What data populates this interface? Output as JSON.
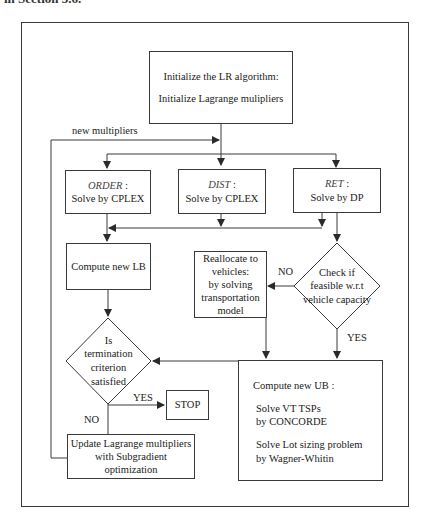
{
  "caption_fragment": "in Section 5.6.",
  "nodes": {
    "init": {
      "line1": "Initialize the LR algorithm:",
      "line2": "Initialize Lagrange mulipliers"
    },
    "order": {
      "name": "ORDER",
      "suffix": " :",
      "action": "Solve by CPLEX"
    },
    "dist": {
      "name": "DIST",
      "suffix": " :",
      "action": "Solve by CPLEX"
    },
    "ret": {
      "name": "RET",
      "suffix": " :",
      "action": "Solve by DP"
    },
    "compute_lb": {
      "label": "Compute new LB"
    },
    "reallocate": {
      "lines": [
        "Reallocate to",
        "vehicles:",
        "by solving",
        "transportation",
        "model"
      ]
    },
    "check_feasible": {
      "lines": [
        "Check if",
        "feasible w.r.t",
        "vehicle capacity"
      ]
    },
    "termination": {
      "lines": [
        "Is",
        "termination",
        "criterion",
        "satisfied"
      ]
    },
    "stop": {
      "label": "STOP"
    },
    "update": {
      "line1": "Update Lagrange multipliers",
      "line2": "with Subgradient optimization"
    },
    "compute_ub": {
      "title": "Compute new UB :",
      "step1_line1": "Solve VT TSPs",
      "step1_line2": "by CONCORDE",
      "step2_line1": "Solve Lot sizing problem",
      "step2_line2": "by Wagner-Whitin"
    }
  },
  "edge_labels": {
    "new_multipliers": "new multipliers",
    "check_no": "NO",
    "check_yes": "YES",
    "term_yes": "YES",
    "term_no": "NO"
  },
  "colors": {
    "line": "#3a3a3a",
    "background": "#ffffff",
    "text": "#1a1a1a"
  }
}
